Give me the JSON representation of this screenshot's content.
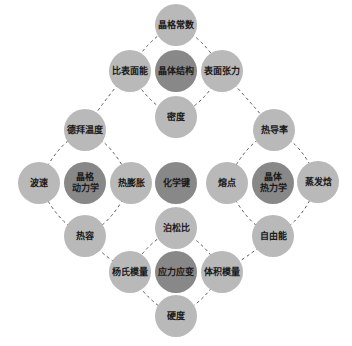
{
  "colors": {
    "background": "#ffffff",
    "node_light": "#b9b9b9",
    "node_dark": "#888888",
    "text": "#1a1a1a",
    "dash_line": "#444444"
  },
  "nodes": {
    "center": {
      "label": "化学键"
    },
    "top": {
      "hub": "晶体结构",
      "north": "晶格常数",
      "west": "比表面能",
      "east": "表面张力",
      "south": "密度"
    },
    "left": {
      "hub": "晶格\n动力学",
      "north": "德拜温度",
      "west": "波速",
      "east": "热膨胀",
      "south": "热容"
    },
    "right": {
      "hub": "晶体\n热力学",
      "north": "热导率",
      "west": "熔点",
      "east": "蒸发焓",
      "south": "自由能"
    },
    "bottom": {
      "hub": "应力应变",
      "north": "泊松比",
      "west": "杨氏模量",
      "east": "体积模量",
      "south": "硬度"
    }
  }
}
